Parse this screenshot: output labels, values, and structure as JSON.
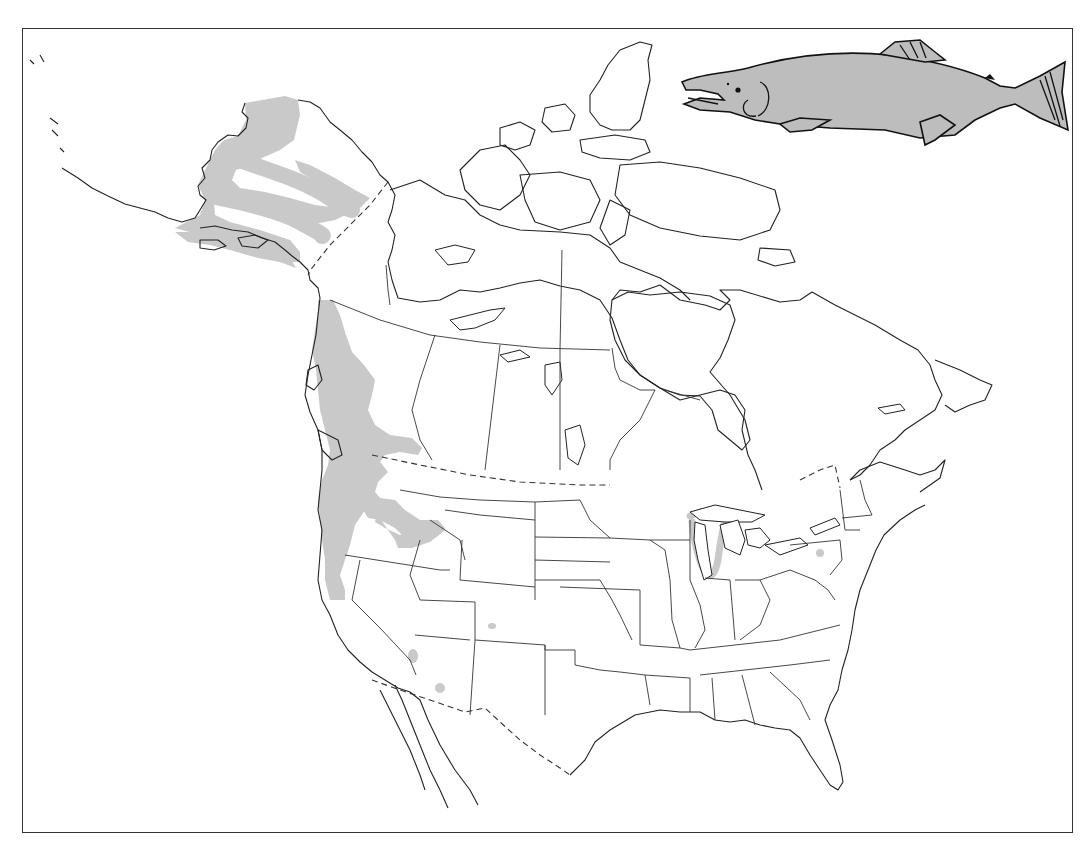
{
  "figure": {
    "type": "species-range-map",
    "subject_illustration": "sockeye-salmon-icon",
    "region": "North America",
    "frame": {
      "x": 22,
      "y": 28,
      "width": 1051,
      "height": 805
    }
  },
  "legend": {
    "range_fill_color": "#c9c9c9",
    "outline_color": "#222222",
    "background_color": "#ffffff"
  },
  "range_areas": [
    {
      "name": "alaska-western",
      "desc": "Western Alaska drainages (Bristol Bay, Yukon, Kuskokwim)"
    },
    {
      "name": "pacific-coast",
      "desc": "Pacific coast from SE Alaska through British Columbia to northern California"
    },
    {
      "name": "columbia-snake",
      "desc": "Columbia and Snake River drainages into Idaho"
    },
    {
      "name": "great-lakes",
      "desc": "Lake Michigan shoreline (introduced)"
    },
    {
      "name": "isolated-points",
      "desc": "Isolated introduced populations: Pennsylvania, Colorado, Arizona, Nevada/California border"
    }
  ],
  "map_features": {
    "international_borders": "dashed",
    "state_province_borders": "solid"
  }
}
